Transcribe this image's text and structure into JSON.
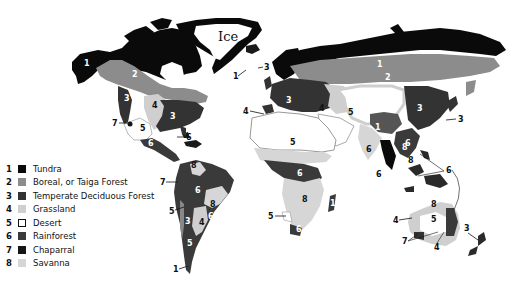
{
  "map": {
    "ice_label": "Ice",
    "colors": {
      "tundra": "#0a0a0a",
      "boreal": "#8c8c8c",
      "temperate": "#3a3a3a",
      "grassland": "#cfcfcf",
      "desert": "#ffffff",
      "rainforest": "#3c3c3c",
      "chaparral": "#1a1a1a",
      "savanna": "#d4d4d4"
    },
    "annotations": {
      "na": [
        "1",
        "2",
        "3",
        "4",
        "3",
        "7",
        "5",
        "6",
        "6",
        "1",
        "3"
      ],
      "sa": [
        "8",
        "7",
        "6",
        "5",
        "3",
        "8",
        "4",
        "6",
        "5",
        "1"
      ],
      "eu": [
        "2",
        "3",
        "4",
        "4",
        "5",
        "5",
        "1",
        "6",
        "8",
        "3",
        "6",
        "8",
        "6",
        "3",
        "1"
      ],
      "af": [
        "6",
        "8",
        "5",
        "6"
      ],
      "au": [
        "6",
        "8",
        "5",
        "4",
        "7",
        "4",
        "3"
      ]
    }
  },
  "legend": {
    "items": [
      {
        "num": "1",
        "label": "Tundra",
        "color": "#0a0a0a",
        "border": "#0a0a0a"
      },
      {
        "num": "2",
        "label": "Boreal, or Taiga Forest",
        "color": "#8c8c8c",
        "border": "#8c8c8c"
      },
      {
        "num": "3",
        "label": "Temperate Deciduous Forest",
        "color": "#333333",
        "border": "#333333"
      },
      {
        "num": "4",
        "label": "Grassland",
        "color": "#cfcfcf",
        "border": "#cfcfcf"
      },
      {
        "num": "5",
        "label": "Desert",
        "color": "#ffffff",
        "border": "#111111"
      },
      {
        "num": "6",
        "label": "Rainforest",
        "color": "#3a3a3a",
        "border": "#3a3a3a"
      },
      {
        "num": "7",
        "label": "Chaparral",
        "color": "#151515",
        "border": "#151515"
      },
      {
        "num": "8",
        "label": "Savanna",
        "color": "#d6d6d6",
        "border": "#d6d6d6"
      }
    ]
  }
}
